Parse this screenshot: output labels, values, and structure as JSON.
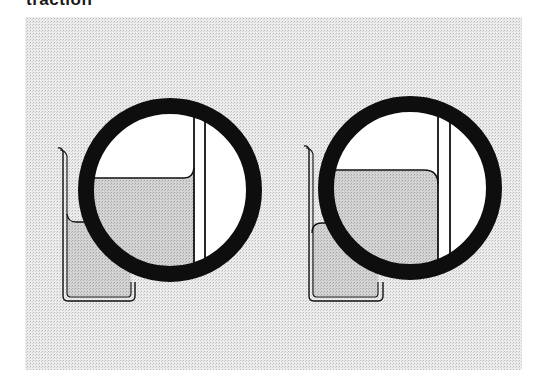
{
  "caption_fragment": "traction",
  "figure": {
    "colors": {
      "page": "#ffffff",
      "panel_background": "#e3e3e3",
      "liquid": "#c9c9c9",
      "outline": "#111111",
      "inset_background": "#ffffff"
    },
    "left": {
      "label": "concave-meniscus",
      "beaker": {
        "x": 62,
        "lip_y": 148,
        "bottom_y": 300,
        "right_x": 135,
        "liquid_y": 222
      },
      "inset": {
        "cx": 170,
        "cy": 190,
        "r": 84,
        "ring": 16,
        "wall_x1": 194,
        "wall_x2": 205,
        "liquid_y": 178
      }
    },
    "right": {
      "label": "convex-meniscus",
      "beaker": {
        "x": 308,
        "lip_y": 146,
        "bottom_y": 300,
        "right_x": 383,
        "liquid_y": 223
      },
      "inset": {
        "cx": 410,
        "cy": 188,
        "r": 84,
        "ring": 16,
        "wall_x1": 438,
        "wall_x2": 450,
        "liquid_y": 170
      }
    }
  }
}
